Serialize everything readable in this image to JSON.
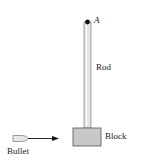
{
  "diagram": {
    "labels": {
      "pivot": "A",
      "rod": "Rod",
      "block": "Block",
      "bullet": "Bullet"
    },
    "colors": {
      "rod_fill": "#e4e4e4",
      "rod_edge": "#8a8a8a",
      "block_fill": "#c8c8c8",
      "block_edge": "#555555",
      "pivot": "#111111",
      "arrow": "#111111",
      "bullet_fill": "#e6e6e6"
    }
  }
}
